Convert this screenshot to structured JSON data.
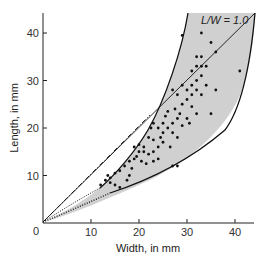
{
  "chart_data": {
    "type": "scatter",
    "title": "",
    "xlabel": "Width, in mm",
    "ylabel": "Length, in mm",
    "xlim": [
      0,
      44
    ],
    "ylim": [
      0,
      44
    ],
    "xticks": [
      0,
      10,
      20,
      30,
      40
    ],
    "yticks": [
      10,
      20,
      30,
      40
    ],
    "origin_label": "0",
    "grid": false,
    "legend": null,
    "annotations": [
      {
        "text": "L/W = 1.0",
        "x": 34,
        "y": 42,
        "refers_to": "reference line L = W"
      }
    ],
    "reference_lines": [
      {
        "name": "L/W = 1.0",
        "style": "solid",
        "points": [
          [
            0,
            0
          ],
          [
            44,
            44
          ]
        ]
      },
      {
        "name": "upper envelope extension",
        "style": "dash-dot",
        "points": [
          [
            0,
            0
          ],
          [
            22,
            22.5
          ]
        ]
      },
      {
        "name": "lower envelope extension",
        "style": "dotted",
        "points": [
          [
            0,
            0
          ],
          [
            16,
            8
          ]
        ]
      }
    ],
    "shaded_envelope": {
      "fill": "#d0d0d0",
      "upper_boundary": [
        [
          12,
          7.2
        ],
        [
          16,
          11
        ],
        [
          20,
          16
        ],
        [
          24,
          22
        ],
        [
          27,
          28
        ],
        [
          30,
          35
        ],
        [
          32,
          40
        ],
        [
          33,
          44
        ]
      ],
      "lower_boundary": [
        [
          14,
          6
        ],
        [
          20,
          9
        ],
        [
          25,
          12.5
        ],
        [
          30,
          17
        ],
        [
          35,
          23
        ],
        [
          39,
          30
        ],
        [
          42,
          37
        ],
        [
          44.5,
          44
        ]
      ]
    },
    "series": [
      {
        "name": "observations",
        "marker": "dot",
        "color": "#111111",
        "points": [
          [
            12,
            8
          ],
          [
            13,
            9
          ],
          [
            13.5,
            10
          ],
          [
            14,
            8.5
          ],
          [
            14,
            9.5
          ],
          [
            15,
            10.5
          ],
          [
            15,
            8
          ],
          [
            16,
            11
          ],
          [
            17,
            12
          ],
          [
            18,
            13
          ],
          [
            18.5,
            11.5
          ],
          [
            19,
            13.5
          ],
          [
            19.5,
            14
          ],
          [
            20,
            15
          ],
          [
            20.5,
            13
          ],
          [
            21,
            15
          ],
          [
            19,
            16
          ],
          [
            20,
            16.5
          ],
          [
            21,
            16
          ],
          [
            21.5,
            12.5
          ],
          [
            22,
            14.5
          ],
          [
            23,
            15
          ],
          [
            22,
            18
          ],
          [
            23,
            17.5
          ],
          [
            24,
            16
          ],
          [
            24.5,
            18
          ],
          [
            25,
            17
          ],
          [
            25,
            19
          ],
          [
            26,
            20
          ],
          [
            26.5,
            16
          ],
          [
            22.5,
            20
          ],
          [
            23,
            21
          ],
          [
            24,
            20
          ],
          [
            25,
            21
          ],
          [
            25.5,
            22.5
          ],
          [
            26,
            23.5
          ],
          [
            27,
            19
          ],
          [
            27,
            21
          ],
          [
            27.5,
            24
          ],
          [
            28,
            18
          ],
          [
            28,
            22
          ],
          [
            28.5,
            23
          ],
          [
            29,
            20.5
          ],
          [
            29,
            25
          ],
          [
            30,
            22
          ],
          [
            30.5,
            21
          ],
          [
            30,
            26
          ],
          [
            31,
            24.5
          ],
          [
            31,
            27
          ],
          [
            32,
            23
          ],
          [
            27,
            28
          ],
          [
            28,
            27
          ],
          [
            29,
            29
          ],
          [
            30,
            28
          ],
          [
            31,
            29
          ],
          [
            32,
            28
          ],
          [
            32,
            30
          ],
          [
            33,
            27
          ],
          [
            34,
            29
          ],
          [
            33,
            31
          ],
          [
            31,
            32
          ],
          [
            32,
            33
          ],
          [
            33,
            33
          ],
          [
            34,
            33
          ],
          [
            32,
            35
          ],
          [
            33,
            35
          ],
          [
            35,
            23
          ],
          [
            36,
            28
          ],
          [
            28,
            12
          ],
          [
            27,
            12
          ],
          [
            29,
            39.5
          ],
          [
            33,
            40
          ],
          [
            35,
            38
          ],
          [
            36,
            36
          ],
          [
            41,
            32
          ],
          [
            16,
            7.5
          ],
          [
            17.5,
            9
          ],
          [
            18,
            10
          ],
          [
            23,
            13
          ],
          [
            24,
            13.5
          ]
        ]
      }
    ]
  }
}
